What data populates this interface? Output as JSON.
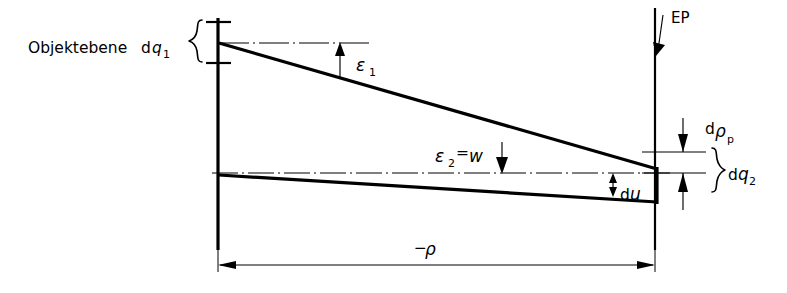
{
  "figure": {
    "background_color": "#ffffff",
    "line_color": "#000000"
  },
  "labels": {
    "object_plane": {
      "text_prefix": "Objektebene",
      "d": "d",
      "symbol": "q",
      "subscript": "1",
      "full": "Objektebene dq₁"
    },
    "epsilon1": {
      "symbol": "ε",
      "subscript": "1",
      "full": "ε₁"
    },
    "epsilon2": {
      "symbol": "ε",
      "subscript": "2",
      "equals": "=",
      "value": "w",
      "full": "ε₂=w"
    },
    "du": {
      "d": "d",
      "symbol": "u",
      "full": "du"
    },
    "d_rho_p": {
      "d": "d",
      "symbol": "ρ",
      "subscript": "p",
      "full": "dρₚ"
    },
    "d_q2": {
      "d": "d",
      "symbol": "q",
      "subscript": "2",
      "full": "dq₂"
    },
    "ep": {
      "text": "EP"
    },
    "rho_dimension": {
      "sign": "−",
      "symbol": "ρ",
      "full": "−ρ"
    }
  },
  "geometry": {
    "left_axis_x": 218,
    "right_axis_x": 655,
    "apex_top_y": 42,
    "center_axis_y": 173,
    "lower_right_y": 203,
    "converge_right_y": 169,
    "baseline_dim_y": 265
  },
  "annotations": {
    "left_brace_label": "Objektebene dq₁",
    "right_brace_label": "dq₂",
    "vertical_dimension_label": "dρₚ",
    "horizontal_dimension_label": "−ρ",
    "entrance_pupil_label": "EP"
  }
}
